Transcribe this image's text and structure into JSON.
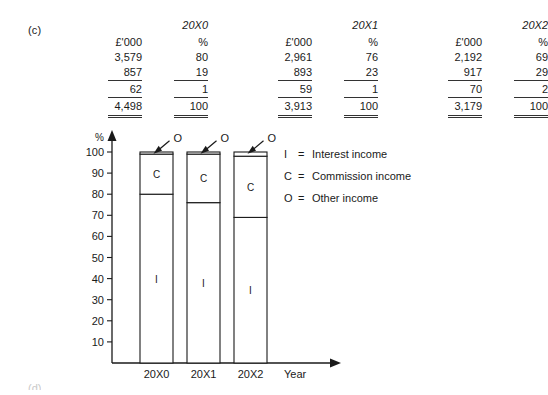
{
  "part_label": "(c)",
  "footer_cut_label": "(d)",
  "table": {
    "year_headers": [
      "20X0",
      "20X1",
      "20X2"
    ],
    "unit_headers": [
      "£'000",
      "%",
      "£'000",
      "%",
      "£'000",
      "%"
    ],
    "rows": [
      {
        "cells": [
          "3,579",
          "80",
          "2,961",
          "76",
          "2,192",
          "69"
        ],
        "style": "plain"
      },
      {
        "cells": [
          "857",
          "19",
          "893",
          "23",
          "917",
          "29"
        ],
        "style": "plain"
      },
      {
        "cells": [
          "62",
          "1",
          "59",
          "1",
          "70",
          "2"
        ],
        "style": "ruled"
      },
      {
        "cells": [
          "4,498",
          "100",
          "3,913",
          "100",
          "3,179",
          "100"
        ],
        "style": "total"
      }
    ]
  },
  "chart_data": {
    "type": "bar",
    "title": "",
    "subtype": "stacked-percentage",
    "xlabel": "Year",
    "ylabel": "%",
    "categories": [
      "20X0",
      "20X1",
      "20X2"
    ],
    "ylim": [
      0,
      100
    ],
    "yticks": [
      10,
      20,
      30,
      40,
      50,
      60,
      70,
      80,
      90,
      100
    ],
    "ytick_labels": [
      "10",
      "20",
      "30",
      "40",
      "50",
      "60",
      "70",
      "80",
      "90",
      "100"
    ],
    "grid": false,
    "legend_position": "right",
    "series": [
      {
        "name": "Interest income",
        "key": "I",
        "values": [
          80,
          76,
          69
        ]
      },
      {
        "name": "Commission income",
        "key": "C",
        "values": [
          19,
          23,
          29
        ]
      },
      {
        "name": "Other income",
        "key": "O",
        "values": [
          1,
          1,
          2
        ]
      }
    ],
    "annotations": [
      {
        "text": "O",
        "target_category": "20X0",
        "target_series": "Other income"
      },
      {
        "text": "O",
        "target_category": "20X1",
        "target_series": "Other income"
      },
      {
        "text": "O",
        "target_category": "20X2",
        "target_series": "Other income"
      }
    ],
    "segment_labels": [
      [
        "I",
        "C"
      ],
      [
        "I",
        "C"
      ],
      [
        "I",
        "C"
      ]
    ]
  },
  "legend": {
    "items": [
      {
        "key": "I",
        "eq": "=",
        "text": "Interest income"
      },
      {
        "key": "C",
        "eq": "=",
        "text": "Commission income"
      },
      {
        "key": "O",
        "eq": "=",
        "text": "Other income"
      }
    ]
  },
  "axis": {
    "y_unit": "%",
    "x_title": "Year"
  }
}
